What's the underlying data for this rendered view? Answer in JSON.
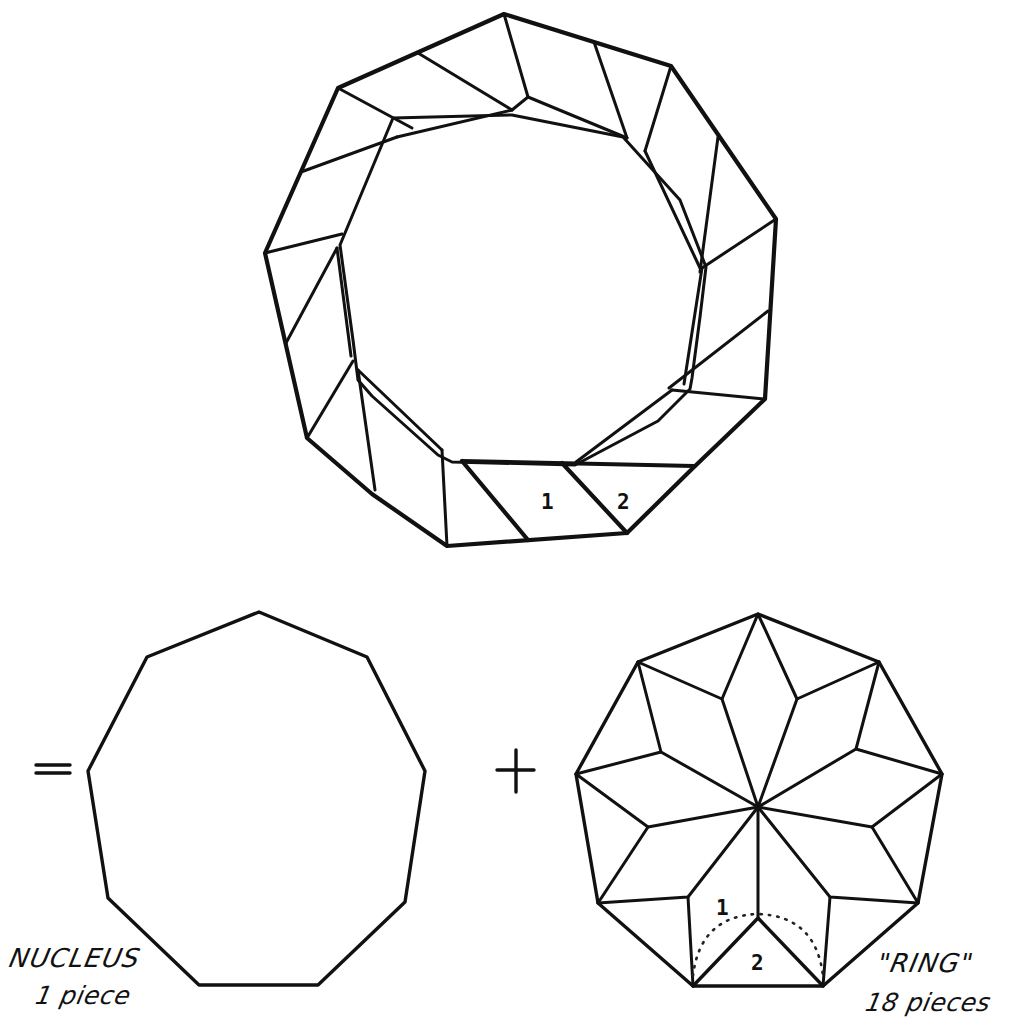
{
  "figure": {
    "type": "geometric dissection",
    "shape": "regular nonagon",
    "relation": "ring-dissected nonagon = nucleus + ring",
    "operators": {
      "equals": "=",
      "plus": "+"
    }
  },
  "top_figure": {
    "description": "Nonagon annulus dissected into 18 quadrilateral/triangular ring pieces",
    "labels": {
      "piece_1": "1",
      "piece_2": "2"
    }
  },
  "nucleus": {
    "label": "NUCLEUS",
    "count_text": "1 piece",
    "sides": 9
  },
  "ring": {
    "label": "\"RING\"",
    "count_text": "18 pieces",
    "piece_count": 18,
    "labels": {
      "piece_1": "1",
      "piece_2": "2"
    },
    "arc": "dotted rotation arc between pieces 1 and 2"
  },
  "colors": {
    "ink": "#111111",
    "paper": "#ffffff"
  }
}
